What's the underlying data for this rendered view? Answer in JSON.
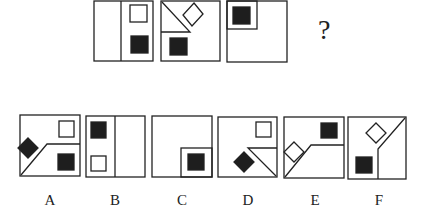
{
  "question_mark": "?",
  "colors": {
    "stroke": "#222222",
    "fill_dark": "#1e1e1e",
    "background": "#ffffff"
  },
  "question_row": [
    {
      "id": "q1",
      "description": "Square split by vertical line; white square top-right, black square bottom-right"
    },
    {
      "id": "q2",
      "description": "Triangle region top-left via diagonal + horizontal line; white diamond top, black square bottom-left"
    },
    {
      "id": "q3",
      "description": "Small inner square top-left containing black square"
    }
  ],
  "options": [
    {
      "label": "A",
      "description": "Bent line bottom-left; black diamond left, white square top-right, black square bottom-right"
    },
    {
      "label": "B",
      "description": "Vertical line; black square top-left, white square bottom-left"
    },
    {
      "label": "C",
      "description": "Small inner square bottom-right containing black square"
    },
    {
      "label": "D",
      "description": "Bent line bottom-right; white square top-right, black diamond bottom-left"
    },
    {
      "label": "E",
      "description": "Bent line bottom-left; white diamond left, black square top-right"
    },
    {
      "label": "F",
      "description": "Bent line right (diagonal + vertical); white diamond top, black square bottom-left"
    }
  ]
}
